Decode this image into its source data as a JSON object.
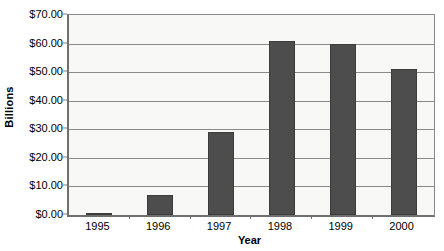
{
  "chart_data": {
    "type": "bar",
    "title": "",
    "subtitle": "",
    "xlabel": "Year",
    "ylabel": "Billions",
    "categories": [
      "1995",
      "1996",
      "1997",
      "1998",
      "1999",
      "2000"
    ],
    "values": [
      0.8,
      7.0,
      29.0,
      61.0,
      60.0,
      51.0
    ],
    "series": [
      {
        "name": "Billions",
        "values": [
          0.8,
          7.0,
          29.0,
          61.0,
          60.0,
          51.0
        ]
      }
    ],
    "ylim": [
      0,
      70
    ],
    "ytick_values": [
      0,
      10,
      20,
      30,
      40,
      50,
      60,
      70
    ],
    "ytick_labels": [
      "$0.00",
      "$10.00",
      "$20.00",
      "$30.00",
      "$40.00",
      "$50.00",
      "$60.00",
      "$70.00"
    ],
    "ytick_step": 10,
    "grid": true,
    "grid_axis": "y",
    "legend": false,
    "legend_position": "none",
    "bar_color": "#4d4d4d",
    "bar_border_color": "#3c3c3c",
    "plot_background": "#f8f8f6",
    "axis_color": "#6f6f6f",
    "gridline_color": "#8a8a8a",
    "annotations": []
  }
}
